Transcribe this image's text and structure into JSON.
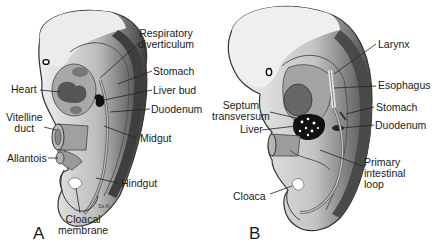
{
  "figure": {
    "panels": [
      {
        "id": "A",
        "label": "A",
        "structures": {
          "respiratory_diverticulum": "Respiratory diverticulum",
          "respiratory_line1": "Respiratory",
          "respiratory_line2": "diverticulum",
          "heart": "Heart",
          "stomach": "Stomach",
          "liver_bud": "Liver bud",
          "duodenum": "Duodenum",
          "vitelline_line1": "Vitelline",
          "vitelline_line2": "duct",
          "midgut": "Midgut",
          "allantois": "Allantois",
          "hindgut": "Hindgut",
          "cloacal_line1": "Cloacal",
          "cloacal_line2": "membrane"
        },
        "signature": "Sa.R."
      },
      {
        "id": "B",
        "label": "B",
        "structures": {
          "larynx": "Larynx",
          "esophagus": "Esophagus",
          "septum_line1": "Septum",
          "septum_line2": "transversum",
          "stomach": "Stomach",
          "liver": "Liver",
          "duodenum": "Duodenum",
          "primary_line1": "Primary",
          "primary_line2": "intestinal",
          "primary_line3": "loop",
          "cloaca": "Cloaca"
        }
      }
    ],
    "colors": {
      "head_light": "#e8e8e8",
      "body_mid": "#bdbdbd",
      "body_dark": "#5a5a5a",
      "outline": "#3a3a3a",
      "organ_dark": "#4a4a4a",
      "gut": "#9a9a9a"
    }
  }
}
